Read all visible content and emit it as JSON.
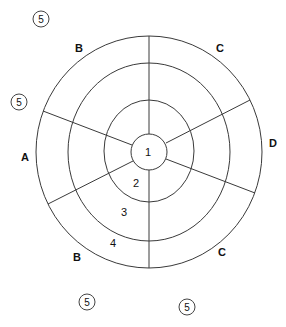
{
  "diagram": {
    "type": "concentric-zone-diagram",
    "ring_labels": [
      "1",
      "2",
      "3",
      "4"
    ],
    "sector_labels": [
      "B",
      "C",
      "D",
      "C",
      "B",
      "A"
    ],
    "outer_markers": [
      "5",
      "5",
      "5",
      "5"
    ],
    "colors": {
      "line": "#3a3a3a",
      "text": "#111111",
      "background": "#ffffff"
    }
  }
}
